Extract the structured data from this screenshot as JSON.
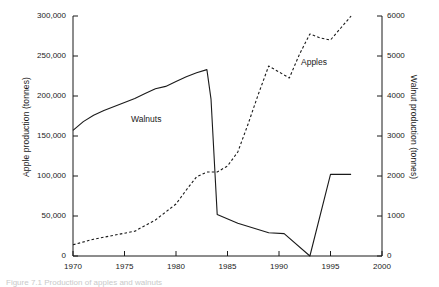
{
  "figure": {
    "caption": "Figure 7.1 Production of apples and walnuts",
    "background": "#ffffff",
    "ink_color": "#1a1a1a"
  },
  "axes": {
    "x": {
      "label": "",
      "min": 1970,
      "max": 2000,
      "ticks": [
        1970,
        1975,
        1980,
        1985,
        1990,
        1995,
        2000
      ],
      "tick_labels": [
        "1970",
        "1975",
        "1980",
        "1985",
        "1990",
        "1995",
        "2000"
      ]
    },
    "y_left": {
      "label": "Apple production (tonnes)",
      "min": 0,
      "max": 300000,
      "ticks": [
        0,
        50000,
        100000,
        150000,
        200000,
        250000,
        300000
      ],
      "tick_labels": [
        "0",
        "50,000",
        "100,000",
        "150,000",
        "200,000",
        "250,000",
        "300,000"
      ]
    },
    "y_right": {
      "label": "Walnut production (tonnes)",
      "min": 0,
      "max": 6000,
      "ticks": [
        0,
        1000,
        2000,
        3000,
        4000,
        5000,
        6000
      ],
      "tick_labels": [
        "0",
        "1000",
        "2000",
        "3000",
        "4000",
        "5000",
        "6000"
      ]
    }
  },
  "annotations": {
    "walnuts_label": "Walnuts",
    "apples_label": "Apples"
  },
  "chart_data": {
    "type": "line",
    "title": "",
    "xlabel": "",
    "ylabel": "Apple production (tonnes)",
    "ylabel_secondary": "Walnut production (tonnes)",
    "xlim": [
      1970,
      2000
    ],
    "ylim": [
      0,
      300000
    ],
    "ylim_secondary": [
      0,
      6000
    ],
    "grid": false,
    "legend": "inline-annotations",
    "series": [
      {
        "name": "Walnuts",
        "axis": "left",
        "style": "solid",
        "color": "#1a1a1a",
        "x": [
          1970,
          1971,
          1972,
          1973,
          1974,
          1975,
          1976,
          1977,
          1978,
          1979,
          1980,
          1981,
          1982,
          1983,
          1983.4,
          1984,
          1986,
          1989,
          1990.5,
          1993,
          1995,
          1997
        ],
        "y": [
          157000,
          168000,
          176000,
          182000,
          187000,
          192000,
          197000,
          203000,
          209000,
          212000,
          218000,
          224000,
          229000,
          233000,
          196000,
          52000,
          41000,
          29000,
          28000,
          0,
          102000,
          102000
        ]
      },
      {
        "name": "Apples",
        "axis": "right",
        "style": "dashed",
        "color": "#1a1a1a",
        "x": [
          1970,
          1972,
          1974,
          1976,
          1978,
          1980,
          1981,
          1982,
          1983,
          1984,
          1985,
          1986,
          1987,
          1988,
          1989,
          1990,
          1991,
          1992,
          1993,
          1994,
          1995,
          1996,
          1997
        ],
        "y": [
          280,
          420,
          520,
          620,
          900,
          1300,
          1650,
          1980,
          2100,
          2100,
          2250,
          2600,
          3300,
          4050,
          4750,
          4600,
          4450,
          5050,
          5550,
          5450,
          5400,
          5700,
          6000
        ]
      }
    ]
  }
}
